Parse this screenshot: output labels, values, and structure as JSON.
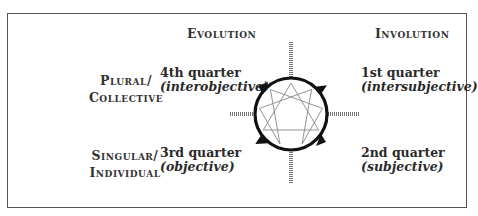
{
  "columns": {
    "left_header": "Evolution",
    "right_header": "Involution"
  },
  "rows": {
    "top": {
      "line1": "Plural/",
      "line2": "Collective"
    },
    "bottom": {
      "line1": "Singular/",
      "line2": "Individual"
    }
  },
  "quarters": {
    "q4": {
      "title": "4th quarter",
      "subtitle": "(interobjective)"
    },
    "q1": {
      "title": "1st quarter",
      "subtitle": "(intersubjective)"
    },
    "q3": {
      "title": "3rd quarter",
      "subtitle": "(objective)"
    },
    "q2": {
      "title": "2nd quarter",
      "subtitle": "(subjective)"
    }
  },
  "figure": {
    "symbol": "enneagram",
    "circle_direction": "clockwise",
    "arrow_count": 4,
    "axis_color": "#777777",
    "circle_color": "#111111",
    "star_color": "#888888"
  }
}
